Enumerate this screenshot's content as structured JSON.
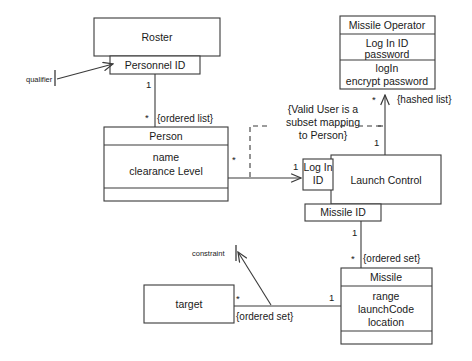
{
  "diagram": {
    "type": "uml-class-diagram",
    "classes": [
      {
        "id": "roster",
        "name": "Roster",
        "attributes": [],
        "operations": []
      },
      {
        "id": "person",
        "name": "Person",
        "attributes": [
          "name",
          "clearance Level"
        ],
        "operations": []
      },
      {
        "id": "missile-operator",
        "name": "Missile Operator",
        "attributes": [
          "Log In ID",
          "password"
        ],
        "operations": [
          "logIn",
          "encrypt password"
        ]
      },
      {
        "id": "launch-control",
        "name": "Launch Control",
        "attributes": [],
        "operations": []
      },
      {
        "id": "missile",
        "name": "Missile",
        "attributes": [
          "range",
          "launchCode",
          "location"
        ],
        "operations": []
      },
      {
        "id": "target",
        "name": "target",
        "attributes": [],
        "operations": []
      }
    ],
    "qualifiers": [
      {
        "id": "personnel-id",
        "label": "Personnel ID",
        "owner": "roster"
      },
      {
        "id": "login-id",
        "label": "Log In\nID",
        "line1": "Log In",
        "line2": "ID",
        "owner": "launch-control"
      },
      {
        "id": "missile-id",
        "label": "Missile ID",
        "owner": "launch-control"
      }
    ],
    "note": {
      "line1": "{Valid User is a",
      "line2": "subset mapping",
      "line3": "to Person}"
    },
    "annotations": [
      {
        "id": "qualifier-callout",
        "label": "qualifier"
      },
      {
        "id": "constraint-callout",
        "label": "constraint"
      }
    ],
    "multiplicities": [
      {
        "id": "roster-person-one",
        "label": "1"
      },
      {
        "id": "roster-person-many",
        "label": "*"
      },
      {
        "id": "person-launch-many",
        "label": "*"
      },
      {
        "id": "person-launch-one",
        "label": "1"
      },
      {
        "id": "launch-operator-one",
        "label": "1"
      },
      {
        "id": "launch-operator-many",
        "label": "*"
      },
      {
        "id": "launch-missile-one",
        "label": "1"
      },
      {
        "id": "launch-missile-many",
        "label": "*"
      },
      {
        "id": "missile-target-one",
        "label": "1"
      },
      {
        "id": "missile-target-many",
        "label": "*"
      }
    ],
    "constraint_labels": [
      {
        "id": "ordered-list",
        "label": "{ordered list}"
      },
      {
        "id": "hashed-list",
        "label": "{hashed list}"
      },
      {
        "id": "ordered-set-missile",
        "label": "{ordered set}"
      },
      {
        "id": "ordered-set-target",
        "label": "{ordered set}"
      }
    ]
  }
}
